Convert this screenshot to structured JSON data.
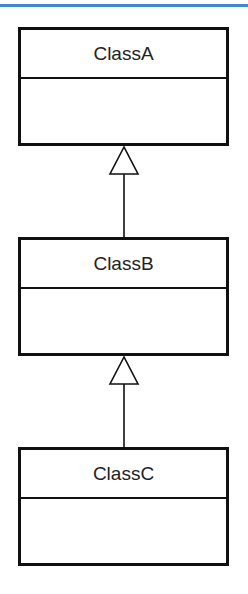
{
  "diagram": {
    "type": "UML class diagram (inheritance chain)",
    "classes": [
      {
        "name": "ClassA"
      },
      {
        "name": "ClassB"
      },
      {
        "name": "ClassC"
      }
    ],
    "relations": [
      {
        "from": "ClassB",
        "to": "ClassA",
        "kind": "generalization"
      },
      {
        "from": "ClassC",
        "to": "ClassB",
        "kind": "generalization"
      }
    ],
    "colors": {
      "accent_line": "#3f86d4",
      "stroke": "#111111"
    }
  }
}
